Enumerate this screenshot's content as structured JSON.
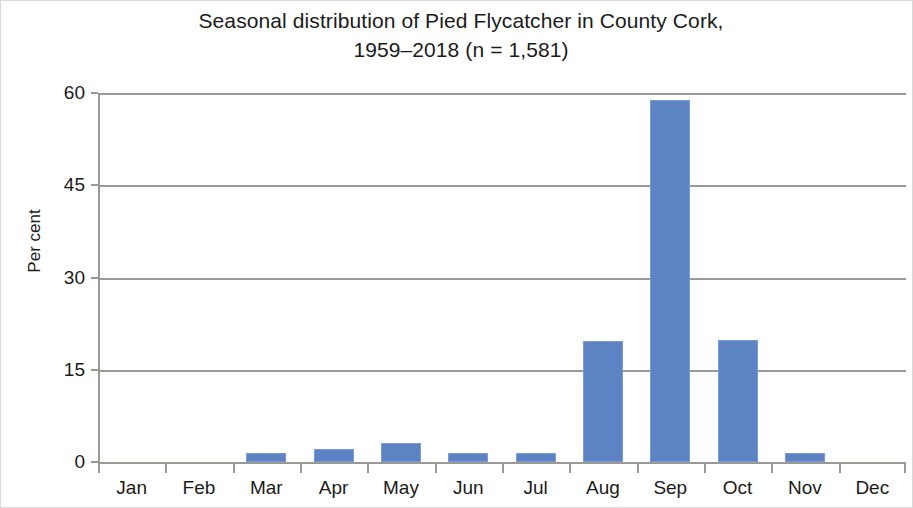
{
  "chart_data": {
    "type": "bar",
    "title": "Seasonal distribution of Pied Flycatcher in County Cork,\n1959–2018 (n = 1,581)",
    "title_line1": "Seasonal distribution of Pied Flycatcher in County Cork,",
    "title_line2": "1959–2018 (n = 1,581)",
    "xlabel": "",
    "ylabel": "Per cent",
    "categories": [
      "Jan",
      "Feb",
      "Mar",
      "Apr",
      "May",
      "Jun",
      "Jul",
      "Aug",
      "Sep",
      "Oct",
      "Nov",
      "Dec"
    ],
    "values": [
      0,
      0,
      1.5,
      2.1,
      3.1,
      1.4,
      1.4,
      19.6,
      58.9,
      19.9,
      1.4,
      0
    ],
    "ylim": [
      0,
      60
    ],
    "yticks": [
      0,
      15,
      30,
      45,
      60
    ],
    "ytick_labels": [
      "0",
      "15",
      "30",
      "45",
      "60"
    ],
    "grid": true,
    "legend": false,
    "bar_color": "#5e83c4",
    "bar_border_color": "#7b9ad4",
    "axis_color": "#9a9a95",
    "sample_size": "n = 1,581",
    "period": "1959–2018"
  }
}
